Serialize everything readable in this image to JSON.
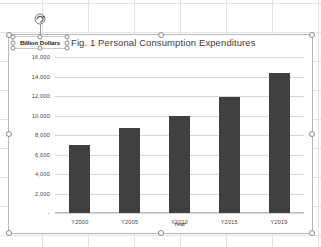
{
  "app": {
    "context": "spreadsheet-chart-selected"
  },
  "textbox": {
    "label": "Billion Dollars",
    "name": "billion-dollars-textbox",
    "selected": true
  },
  "icons": {
    "rotate": "rotate-handle-icon"
  },
  "axis": {
    "x_title": "Year"
  },
  "colors": {
    "bar_fill": "#404040",
    "gridline": "#d6d6d6",
    "frame": "#b9b9b9",
    "sheet_grid": "#dfdfdf"
  },
  "chart_data": {
    "type": "bar",
    "title": "Fig. 1 Personal Consumption Expenditures",
    "xlabel": "Year",
    "ylabel": "Billion Dollars",
    "categories": [
      "Y2000",
      "Y2005",
      "Y2010",
      "Y2015",
      "Y2019"
    ],
    "values": [
      7000,
      8700,
      9900,
      11900,
      14400
    ],
    "ylim": [
      0,
      16000
    ],
    "ytick_labels": [
      "16,000",
      "14,000",
      "12,000",
      "10,000",
      "8,000",
      "6,000",
      "4,000",
      "2,000",
      "-"
    ],
    "ytick_values": [
      16000,
      14000,
      12000,
      10000,
      8000,
      6000,
      4000,
      2000,
      0
    ],
    "grid": true,
    "legend": false
  }
}
